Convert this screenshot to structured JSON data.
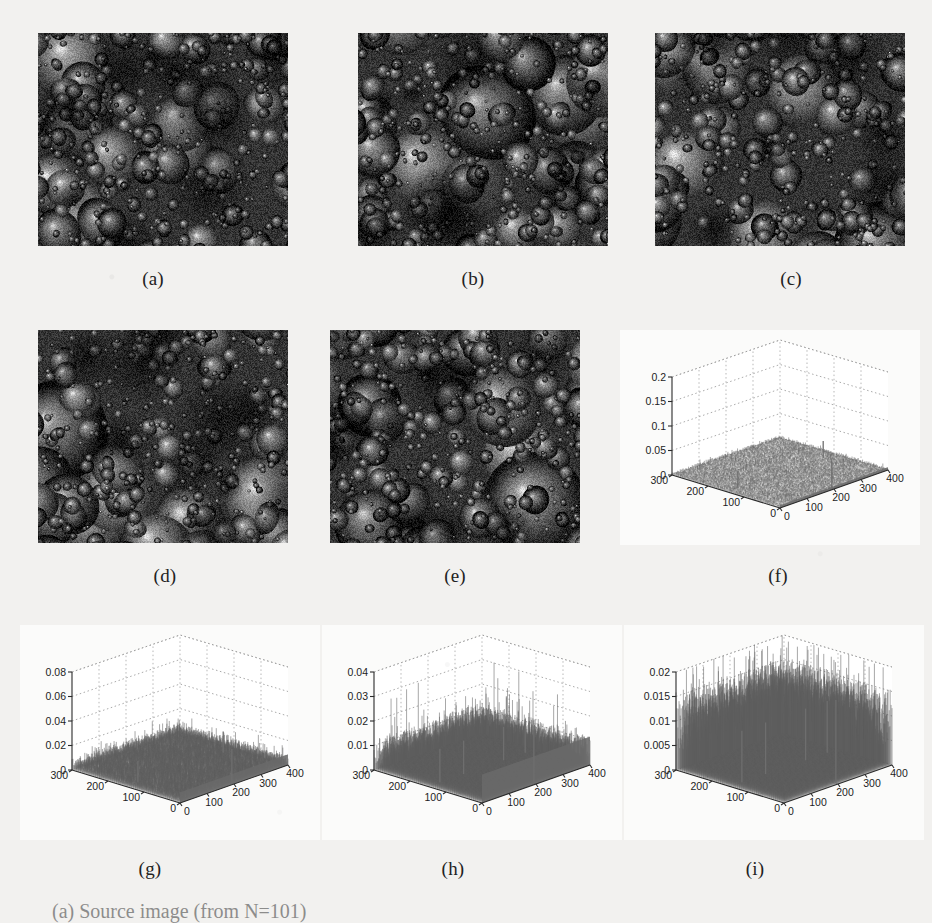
{
  "figure": {
    "background_color": "#f2f1ef",
    "panel_labels": [
      "(a)",
      "(b)",
      "(c)",
      "(d)",
      "(e)",
      "(f)",
      "(g)",
      "(h)",
      "(i)"
    ],
    "caption": "(a) Source image  (from   N=101)"
  },
  "micrographs": [
    {
      "id": "a",
      "label": "(a)",
      "alt": "grayscale micrograph of rounded grain/bubble microstructure"
    },
    {
      "id": "b",
      "label": "(b)",
      "alt": "grayscale micrograph of rounded grain/bubble microstructure"
    },
    {
      "id": "c",
      "label": "(c)",
      "alt": "grayscale micrograph of rounded grain/bubble microstructure"
    },
    {
      "id": "d",
      "label": "(d)",
      "alt": "grayscale micrograph of rounded grain/bubble microstructure"
    },
    {
      "id": "e",
      "label": "(e)",
      "alt": "grayscale micrograph of rounded grain/bubble microstructure"
    }
  ],
  "chart_data": [
    {
      "id": "f",
      "label": "(f)",
      "type": "surface",
      "title": "",
      "xlabel": "",
      "ylabel": "",
      "zlabel": "",
      "x_ticks": [
        0,
        100,
        200,
        300,
        400
      ],
      "y_ticks": [
        0,
        100,
        200,
        300
      ],
      "z_ticks": [
        0,
        0.05,
        0.1,
        0.15,
        0.2
      ],
      "z_tick_labels": [
        "0",
        "0.05",
        "0.1",
        "0.15",
        "0.2"
      ],
      "zlim": [
        0,
        0.2
      ],
      "xlim": [
        0,
        400
      ],
      "ylim": [
        0,
        300
      ],
      "grid": true,
      "legend": "none",
      "description": "Near-flat low-amplitude residual surface with a tall narrow central spike and two edge spikes",
      "noise_floor": 0.004,
      "spike_peak": 0.055,
      "spike_count": 3
    },
    {
      "id": "g",
      "label": "(g)",
      "type": "surface",
      "title": "",
      "xlabel": "",
      "ylabel": "",
      "zlabel": "",
      "x_ticks": [
        0,
        100,
        200,
        300,
        400
      ],
      "y_ticks": [
        0,
        100,
        200,
        300
      ],
      "z_ticks": [
        0,
        0.02,
        0.04,
        0.06,
        0.08
      ],
      "z_tick_labels": [
        "0",
        "0.02",
        "0.04",
        "0.06",
        "0.08"
      ],
      "zlim": [
        0,
        0.08
      ],
      "xlim": [
        0,
        400
      ],
      "ylim": [
        0,
        300
      ],
      "grid": true,
      "legend": "none",
      "description": "Low rough residual field with one dominant central spike reaching about 0.028 and two smaller edge spikes",
      "noise_floor": 0.006,
      "spike_peak": 0.028,
      "spike_count": 3
    },
    {
      "id": "h",
      "label": "(h)",
      "type": "surface",
      "title": "",
      "xlabel": "",
      "ylabel": "",
      "zlabel": "",
      "x_ticks": [
        0,
        100,
        200,
        300,
        400
      ],
      "y_ticks": [
        0,
        100,
        200,
        300
      ],
      "z_ticks": [
        0,
        0.01,
        0.02,
        0.03,
        0.04
      ],
      "z_tick_labels": [
        "0",
        "0.01",
        "0.02",
        "0.03",
        "0.04"
      ],
      "zlim": [
        0,
        0.04
      ],
      "xlim": [
        0,
        400
      ],
      "ylim": [
        0,
        300
      ],
      "grid": true,
      "legend": "none",
      "description": "Dense rough residual field, typical amplitude near 0.008 with scattered spikes up to about 0.022",
      "noise_floor": 0.008,
      "spike_peak": 0.022,
      "spike_count": 5
    },
    {
      "id": "i",
      "label": "(i)",
      "type": "surface",
      "title": "",
      "xlabel": "",
      "ylabel": "",
      "zlabel": "",
      "x_ticks": [
        0,
        100,
        200,
        300,
        400
      ],
      "y_ticks": [
        0,
        100,
        200,
        300
      ],
      "z_ticks": [
        0,
        0.005,
        0.01,
        0.015,
        0.02
      ],
      "z_tick_labels": [
        "0",
        "0.005",
        "0.01",
        "0.015",
        "0.02"
      ],
      "zlim": [
        0,
        0.02
      ],
      "xlim": [
        0,
        400
      ],
      "ylim": [
        0,
        300
      ],
      "grid": true,
      "legend": "none",
      "description": "Very dense tall grass-like noise field filling the box, typical amplitude near 0.010 with peaks to about 0.017",
      "noise_floor": 0.01,
      "spike_peak": 0.017,
      "spike_count": 40
    }
  ]
}
